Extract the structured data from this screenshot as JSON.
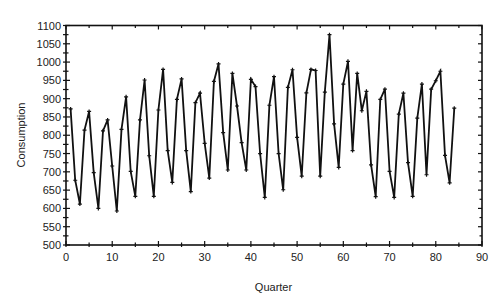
{
  "chart_data": {
    "type": "line",
    "title": "",
    "xlabel": "Quarter",
    "ylabel": "Consumption",
    "xlim": [
      0,
      90
    ],
    "ylim": [
      500,
      1100
    ],
    "xticks": [
      0,
      10,
      20,
      30,
      40,
      50,
      60,
      70,
      80,
      90
    ],
    "yticks": [
      500,
      550,
      600,
      650,
      700,
      750,
      800,
      850,
      900,
      950,
      1000,
      1050,
      1100
    ],
    "grid": false,
    "legend": null,
    "marker": "plus",
    "line_color": "#111111",
    "series": [
      {
        "name": "Consumption",
        "x": [
          1,
          2,
          3,
          4,
          5,
          6,
          7,
          8,
          9,
          10,
          11,
          12,
          13,
          14,
          15,
          16,
          17,
          18,
          19,
          20,
          21,
          22,
          23,
          24,
          25,
          26,
          27,
          28,
          29,
          30,
          31,
          32,
          33,
          34,
          35,
          36,
          37,
          38,
          39,
          40,
          41,
          42,
          43,
          44,
          45,
          46,
          47,
          48,
          49,
          50,
          51,
          52,
          53,
          54,
          55,
          56,
          57,
          58,
          59,
          60,
          61,
          62,
          63,
          64,
          65,
          66,
          67,
          68,
          69,
          70,
          71,
          72,
          73,
          74,
          75,
          76,
          77,
          78,
          79,
          80,
          81,
          82,
          83,
          84
        ],
        "values": [
          872,
          677,
          612,
          814,
          865,
          698,
          600,
          812,
          842,
          716,
          593,
          816,
          905,
          701,
          633,
          842,
          951,
          744,
          633,
          869,
          980,
          758,
          671,
          898,
          954,
          758,
          646,
          889,
          915,
          778,
          683,
          947,
          995,
          807,
          705,
          969,
          880,
          780,
          705,
          953,
          933,
          750,
          630,
          882,
          960,
          750,
          651,
          931,
          979,
          794,
          688,
          916,
          980,
          977,
          688,
          918,
          1075,
          831,
          712,
          940,
          1002,
          758,
          969,
          867,
          920,
          719,
          632,
          898,
          926,
          701,
          630,
          858,
          915,
          725,
          633,
          847,
          940,
          692,
          926,
          949,
          975,
          745,
          670,
          874
        ]
      }
    ]
  }
}
